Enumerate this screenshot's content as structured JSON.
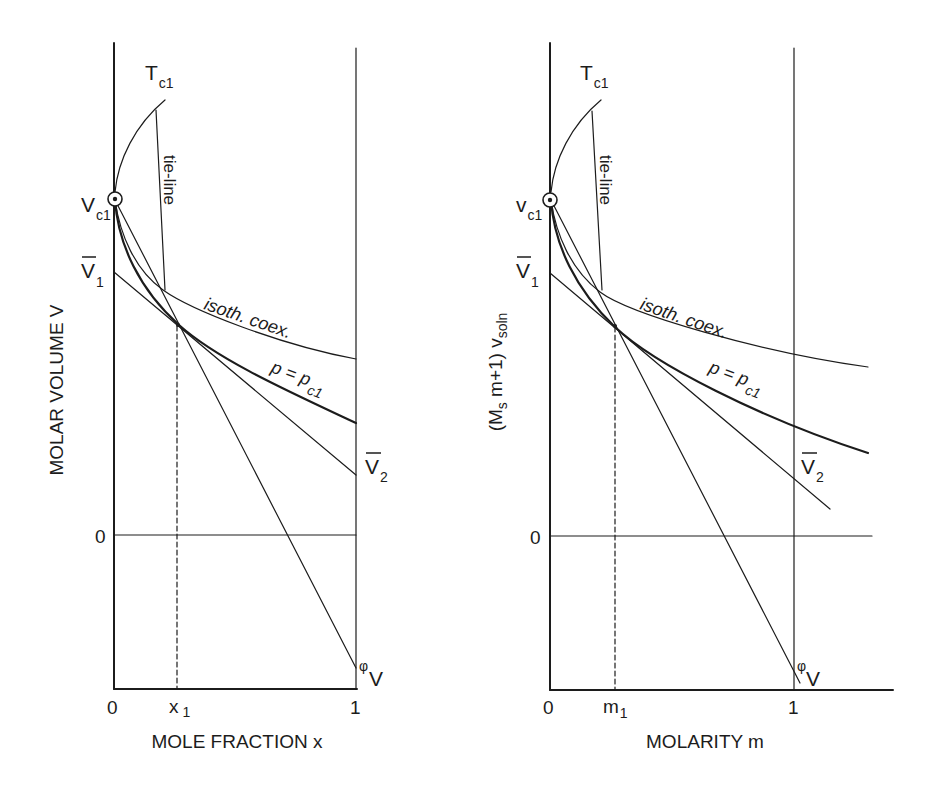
{
  "figure": {
    "colors": {
      "background": "#ffffff",
      "ink": "#1c1c1c"
    },
    "left_panel": {
      "y_axis_label": "MOLAR VOLUME V",
      "x_axis_label": "MOLE FRACTION x",
      "y_zero_tick": "0",
      "x_ticks": {
        "zero": "0",
        "x1_main": "x",
        "x1_sub": "1",
        "one": "1"
      },
      "labels": {
        "tc1": {
          "main": "T",
          "sub": "c1"
        },
        "vc1": {
          "main": "V",
          "sub": "c1"
        },
        "v1bar": {
          "main": "V",
          "sub": "1"
        },
        "v2bar": {
          "main": "V",
          "sub": "2"
        },
        "tie_line": "tie-line",
        "isoth_coex": "isoth. coex.",
        "p_eq": {
          "main": "p = p",
          "sub": "c1"
        },
        "phi_v": {
          "sup": "φ",
          "main": "V"
        }
      }
    },
    "right_panel": {
      "y_axis_label": {
        "open": "(M",
        "sub_s": "s",
        "mid": " m+1) v",
        "sub_soln": "soln"
      },
      "x_axis_label": "MOLARITY m",
      "y_zero_tick": "0",
      "x_ticks": {
        "zero": "0",
        "m1_main": "m",
        "m1_sub": "1",
        "one": "1"
      },
      "labels": {
        "tc1": {
          "main": "T",
          "sub": "c1"
        },
        "vc1": {
          "main": "v",
          "sub": "c1"
        },
        "v1bar": {
          "main": "V",
          "sub": "1"
        },
        "v2bar": {
          "main": "V",
          "sub": "2"
        },
        "tie_line": "tie-line",
        "isoth_coex": "isoth. coex.",
        "p_eq": {
          "main": "p = p",
          "sub": "c1"
        },
        "phi_v": {
          "sup": "φ",
          "main": "V"
        }
      }
    },
    "curves": [
      "critical temperature curve T_c1",
      "tie-line",
      "isothermal coexistence curve",
      "critical isobar p = p_c1",
      "tangent line V1-bar to V2-bar",
      "apparent molar volume line phi-V",
      "dashed composition marker"
    ]
  }
}
